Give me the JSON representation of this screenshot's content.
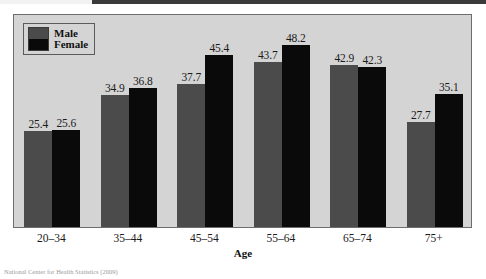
{
  "chart_data": {
    "type": "bar",
    "title": "",
    "subtitle": "",
    "xlabel": "Age",
    "ylabel": "",
    "categories": [
      "20–34",
      "35–44",
      "45–54",
      "55–64",
      "65–74",
      "75+"
    ],
    "series": [
      {
        "name": "Male",
        "color": "#4b4b4b",
        "values": [
          25.4,
          34.9,
          37.7,
          43.7,
          42.9,
          27.7
        ],
        "labels": [
          "25.4",
          "34.9",
          "37.7",
          "43.7",
          "42.9",
          "27.7"
        ]
      },
      {
        "name": "Female",
        "color": "#0a0a0a",
        "values": [
          25.6,
          36.8,
          45.4,
          48.2,
          42.3,
          35.1
        ],
        "labels": [
          "25.6",
          "36.8",
          "45.4",
          "48.2",
          "42.3",
          "35.1"
        ]
      }
    ],
    "ylim": [
      0,
      56
    ],
    "grid": false,
    "legend_position": "top-left",
    "legend_entries": [
      "Male",
      "Female"
    ],
    "plot_background": "#d4d4d4",
    "frame_color": "#6d6d6d"
  },
  "axis": {
    "x_title": "Age"
  },
  "legend": {
    "male_label": "Male",
    "female_label": "Female"
  },
  "footer": {
    "source_note": "National Center for Health Statistics (2009)"
  }
}
